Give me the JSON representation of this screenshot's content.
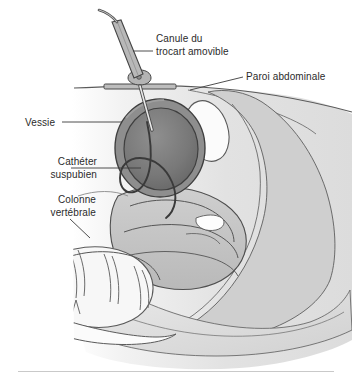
{
  "figure": {
    "language": "fr",
    "width": 352,
    "height": 380,
    "background": "#ffffff",
    "rule_color": "#c9c9c9"
  },
  "labels": {
    "canule": {
      "line1": "Canule du",
      "line2": "trocart amovible"
    },
    "paroi": {
      "line1": "Paroi abdominale"
    },
    "vessie": {
      "line1": "Vessie"
    },
    "catheter": {
      "line1": "Cathéter",
      "line2": "suspubien"
    },
    "colonne": {
      "line1": "Colonne",
      "line2": "vertébrale"
    }
  },
  "colors": {
    "text": "#2b2b2b",
    "leader_line": "#3a3a3a",
    "outline": "#4a4a4a",
    "body_light": "#eeeeee",
    "body_mid": "#d8d8d8",
    "soft_tissue": "#c4c4c4",
    "bladder_wall": "#8c8c8c",
    "bladder_lumen": "#707070",
    "organ_mid": "#9a9a9a",
    "bone_white": "#f6f6f6",
    "uterus_white": "#fbfbfb",
    "cannula_gray": "#b0b0b0"
  },
  "structures": [
    {
      "name": "trocart-cannula",
      "label_key": "canule"
    },
    {
      "name": "abdominal-wall",
      "label_key": "paroi"
    },
    {
      "name": "bladder",
      "label_key": "vessie"
    },
    {
      "name": "suprapubic-catheter",
      "label_key": "catheter"
    },
    {
      "name": "vertebral-column",
      "label_key": "colonne"
    },
    {
      "name": "uterus",
      "label_key": null
    },
    {
      "name": "rectum",
      "label_key": null
    },
    {
      "name": "pubic-bone",
      "label_key": null
    }
  ]
}
